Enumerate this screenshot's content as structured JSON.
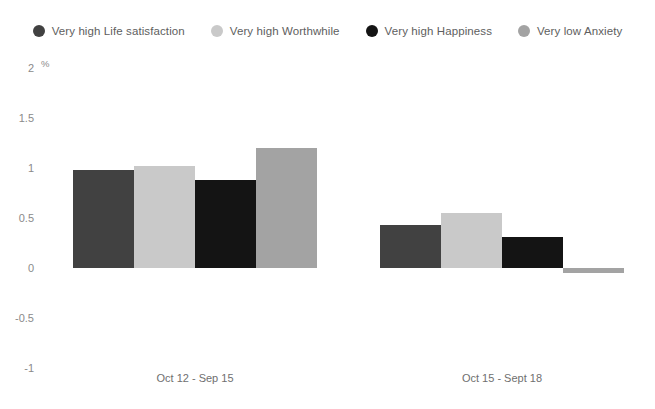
{
  "chart_data": {
    "type": "bar",
    "title": "",
    "subtitle": "",
    "xlabel": "",
    "ylabel": "%",
    "unit": "%",
    "categories": [
      "Oct 12 - Sep 15",
      "Oct 15 - Sept 18"
    ],
    "series": [
      {
        "name": "Very high Life satisfaction",
        "color": "#414141",
        "values": [
          0.98,
          0.43
        ]
      },
      {
        "name": "Very high Worthwhile",
        "color": "#c9c9c9",
        "values": [
          1.02,
          0.55
        ]
      },
      {
        "name": "Very high Happiness",
        "color": "#141414",
        "values": [
          0.88,
          0.31
        ]
      },
      {
        "name": "Very low Anxiety",
        "color": "#a3a3a3",
        "values": [
          1.2,
          -0.05
        ]
      }
    ],
    "ylim": [
      -1,
      2
    ],
    "yticks": [
      2,
      1.5,
      1,
      0.5,
      0,
      -0.5,
      -1
    ],
    "ytick_labels": [
      "2",
      "1.5",
      "1",
      "0.5",
      "0",
      "-0.5",
      "-1"
    ],
    "grid": false,
    "legend_position": "top"
  },
  "legend": {
    "items": [
      {
        "label": "Very high Life satisfaction",
        "color": "#414141"
      },
      {
        "label": "Very high Worthwhile",
        "color": "#c9c9c9"
      },
      {
        "label": "Very high Happiness",
        "color": "#141414"
      },
      {
        "label": "Very low Anxiety",
        "color": "#a3a3a3"
      }
    ]
  }
}
